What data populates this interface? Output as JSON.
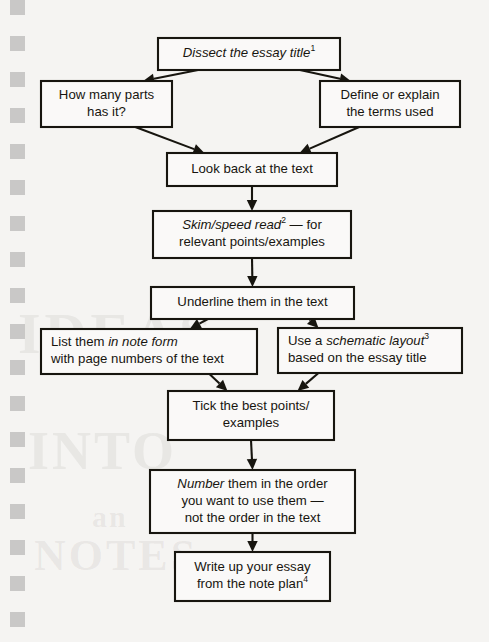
{
  "document": {
    "kind": "printed-page-flowchart",
    "background_color": "#f5f4f2",
    "ink_color": "#17150f",
    "ghost_bleedthrough": [
      "IDEAS",
      "INTO",
      "an",
      "NOTES"
    ]
  },
  "flowchart": {
    "title": "Essay planning flowchart",
    "nodes": [
      {
        "id": "n1",
        "lines": [
          [
            {
              "text": "Dissect the essay title",
              "style": "italic"
            },
            {
              "text": "1",
              "style": "superscript"
            }
          ]
        ],
        "plain": "Dissect the essay title1",
        "x": 158,
        "y": 38,
        "w": 182,
        "h": 32,
        "align": "center"
      },
      {
        "id": "n2",
        "lines": [
          [
            {
              "text": "How many parts",
              "style": "normal"
            }
          ],
          [
            {
              "text": "has it?",
              "style": "normal"
            }
          ]
        ],
        "plain": "How many parts has it?",
        "x": 41,
        "y": 81,
        "w": 131,
        "h": 46,
        "align": "center"
      },
      {
        "id": "n3",
        "lines": [
          [
            {
              "text": "Define or explain",
              "style": "normal"
            }
          ],
          [
            {
              "text": "the terms used",
              "style": "normal"
            }
          ]
        ],
        "plain": "Define or explain the terms used",
        "x": 320,
        "y": 81,
        "w": 140,
        "h": 46,
        "align": "center"
      },
      {
        "id": "n4",
        "lines": [
          [
            {
              "text": "Look back at the text",
              "style": "normal"
            }
          ]
        ],
        "plain": "Look back at the text",
        "x": 167,
        "y": 153,
        "w": 170,
        "h": 33,
        "align": "center"
      },
      {
        "id": "n5",
        "lines": [
          [
            {
              "text": "Skim/speed read",
              "style": "italic"
            },
            {
              "text": "2",
              "style": "superscript"
            },
            {
              "text": " — for",
              "style": "normal"
            }
          ],
          [
            {
              "text": "relevant points/examples",
              "style": "normal"
            }
          ]
        ],
        "plain": "Skim/speed read2 — for relevant points/examples",
        "x": 153,
        "y": 211,
        "w": 198,
        "h": 47,
        "align": "center"
      },
      {
        "id": "n6",
        "lines": [
          [
            {
              "text": "Underline them in the text",
              "style": "normal"
            }
          ]
        ],
        "plain": "Underline them in the text",
        "x": 151,
        "y": 287,
        "w": 203,
        "h": 32,
        "align": "center"
      },
      {
        "id": "n7",
        "lines": [
          [
            {
              "text": "List them ",
              "style": "normal"
            },
            {
              "text": "in note form",
              "style": "italic"
            }
          ],
          [
            {
              "text": "with page numbers of the text",
              "style": "normal"
            }
          ]
        ],
        "plain": "List them in note form with page numbers of the text",
        "x": 41,
        "y": 329,
        "w": 216,
        "h": 45,
        "align": "left"
      },
      {
        "id": "n8",
        "lines": [
          [
            {
              "text": "Use a ",
              "style": "normal"
            },
            {
              "text": "schematic layout",
              "style": "italic"
            },
            {
              "text": "3",
              "style": "superscript"
            }
          ],
          [
            {
              "text": "based on the essay title",
              "style": "normal"
            }
          ]
        ],
        "plain": "Use a schematic layout3 based on the essay title",
        "x": 278,
        "y": 328,
        "w": 184,
        "h": 45,
        "align": "left"
      },
      {
        "id": "n9",
        "lines": [
          [
            {
              "text": "Tick the best points/",
              "style": "normal"
            }
          ],
          [
            {
              "text": "examples",
              "style": "normal"
            }
          ]
        ],
        "plain": "Tick the best points/ examples",
        "x": 168,
        "y": 391,
        "w": 166,
        "h": 49,
        "align": "center"
      },
      {
        "id": "n10",
        "lines": [
          [
            {
              "text": "Number",
              "style": "italic"
            },
            {
              "text": " them in the order",
              "style": "normal"
            }
          ],
          [
            {
              "text": "you want to use them —",
              "style": "normal"
            }
          ],
          [
            {
              "text": "not the order in the text",
              "style": "normal"
            }
          ]
        ],
        "plain": "Number them in the order you want to use them — not the order in the text",
        "x": 150,
        "y": 470,
        "w": 205,
        "h": 63,
        "align": "center"
      },
      {
        "id": "n11",
        "lines": [
          [
            {
              "text": "Write up your essay",
              "style": "normal"
            }
          ],
          [
            {
              "text": "from the note plan",
              "style": "normal"
            },
            {
              "text": "4",
              "style": "superscript"
            }
          ]
        ],
        "plain": "Write up your essay from the note plan4",
        "x": 175,
        "y": 552,
        "w": 155,
        "h": 49,
        "align": "center"
      }
    ],
    "edges": [
      {
        "from": "n1",
        "to": "n2",
        "shape": "diagonal"
      },
      {
        "from": "n1",
        "to": "n3",
        "shape": "diagonal"
      },
      {
        "from": "n2",
        "to": "n4",
        "shape": "diagonal"
      },
      {
        "from": "n3",
        "to": "n4",
        "shape": "diagonal"
      },
      {
        "from": "n4",
        "to": "n5",
        "shape": "vertical"
      },
      {
        "from": "n5",
        "to": "n6",
        "shape": "vertical"
      },
      {
        "from": "n6",
        "to": "n7",
        "shape": "diagonal"
      },
      {
        "from": "n6",
        "to": "n8",
        "shape": "diagonal"
      },
      {
        "from": "n7",
        "to": "n9",
        "shape": "diagonal"
      },
      {
        "from": "n8",
        "to": "n9",
        "shape": "diagonal"
      },
      {
        "from": "n9",
        "to": "n10",
        "shape": "vertical"
      },
      {
        "from": "n10",
        "to": "n11",
        "shape": "vertical"
      }
    ]
  },
  "edge_marks": {
    "count": 17,
    "x": 10,
    "size": 15,
    "y_positions": [
      0,
      36,
      72,
      108,
      144,
      180,
      216,
      252,
      288,
      324,
      360,
      396,
      432,
      468,
      504,
      540,
      576,
      612
    ]
  }
}
